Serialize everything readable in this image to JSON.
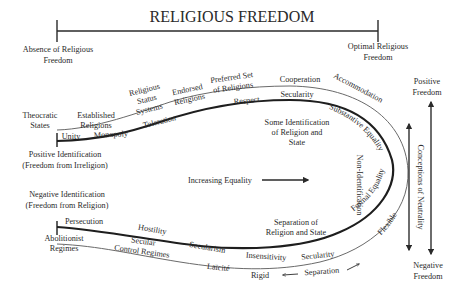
{
  "title": "RELIGIOUS FREEDOM",
  "scale": {
    "left_label_1": "Absence of Religious",
    "left_label_2": "Freedom",
    "right_label_1": "Optimal Religious",
    "right_label_2": "Freedom"
  },
  "left_labels": {
    "positive_1": "Positive Identification",
    "positive_2": "(Freedom from Irreligion)",
    "negative_1": "Negative Identification",
    "negative_2": "(Freedom from Religion)"
  },
  "upper_outer": {
    "theocratic_1": "Theocratic",
    "theocratic_2": "States",
    "established_1": "Established",
    "established_2": "Religions",
    "status_1": "Religious",
    "status_2": "Status",
    "status_3": "Systems",
    "endorsed_1": "Endorsed",
    "endorsed_2": "Religions",
    "preferred_1": "Preferred Set",
    "preferred_2": "of Religions",
    "cooperation": "Cooperation",
    "accommodation": "Accommodation"
  },
  "upper_inner": {
    "unity": "Unity",
    "monopoly": "Monopoly",
    "toleration": "Toleration",
    "respect": "Respect",
    "secularity": "Secularity",
    "substantive_equality": "Substantive Equality"
  },
  "center": {
    "some_id_1": "Some Identification",
    "some_id_2": "of Religion and",
    "some_id_3": "State",
    "increasing_equality": "Increasing Equality",
    "non_identification": "Non-Identification",
    "separation_1": "Separation of",
    "separation_2": "Religion and State"
  },
  "lower_inner": {
    "persecution": "Persecution",
    "hostility": "Hostility",
    "secularism": "Secularism",
    "insensitivity": "Insensitivity",
    "secularity": "Secularity",
    "formal_equality": "Formal Equality"
  },
  "lower_outer": {
    "abolitionist_1": "Abolitionist",
    "abolitionist_2": "Regimes",
    "secular_control_1": "Secular",
    "secular_control_2": "Control Regimes",
    "laicite": "Laïcité",
    "rigid": "Rigid",
    "separation": "Separation",
    "flexible": "Flexible"
  },
  "right_axis": {
    "neutrality": "Conceptions of Neutrality",
    "positive_1": "Positive",
    "positive_2": "Freedom",
    "negative_1": "Negative",
    "negative_2": "Freedom"
  },
  "colors": {
    "ink": "#2a2a2a",
    "thin_line": "#6a6a6a",
    "background": "#ffffff"
  }
}
